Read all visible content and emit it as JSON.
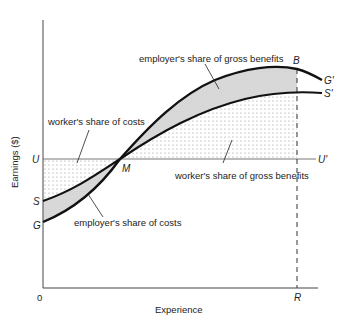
{
  "diagram": {
    "axes": {
      "y_label": "Earnings ($)",
      "x_label": "Experience",
      "origin": "0"
    },
    "points": {
      "U": "U",
      "U_prime": "U'",
      "S": "S",
      "S_prime": "S'",
      "G": "G",
      "G_prime": "G'",
      "M": "M",
      "B": "B",
      "R": "R"
    },
    "annotations": {
      "employer_benefits": "employer's share of gross benefits",
      "worker_costs": "worker's share of costs",
      "worker_benefits": "worker's share of gross benefits",
      "employer_costs": "employer's share of costs"
    },
    "colors": {
      "line": "#111111",
      "axis": "#555555",
      "shade": "#d9d9d9",
      "dots": "#888888"
    }
  }
}
